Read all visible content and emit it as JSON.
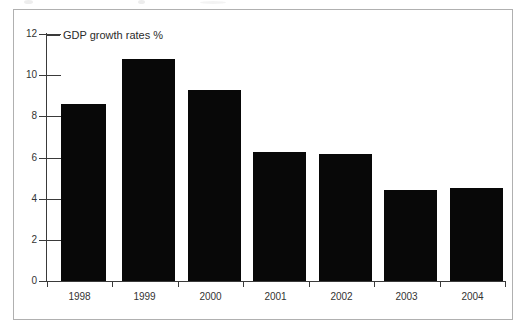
{
  "chart_data": {
    "type": "bar",
    "title": "GDP growth rates %",
    "xlabel": "",
    "ylabel": "",
    "categories": [
      "1998",
      "1999",
      "2000",
      "2001",
      "2002",
      "2003",
      "2004"
    ],
    "values": [
      8.6,
      10.8,
      9.3,
      6.25,
      6.15,
      4.4,
      4.5
    ],
    "ylim": [
      0,
      12
    ],
    "ytick_labels": [
      "0",
      "2",
      "4",
      "6",
      "8",
      "10",
      "12"
    ],
    "ytick_values": [
      0,
      2,
      4,
      6,
      8,
      10,
      12
    ],
    "grid": false,
    "legend": null,
    "bar_color": "#080808",
    "axis_color": "#3a3a3a",
    "frame_color": "#b0b0b0",
    "background": "#ffffff"
  }
}
